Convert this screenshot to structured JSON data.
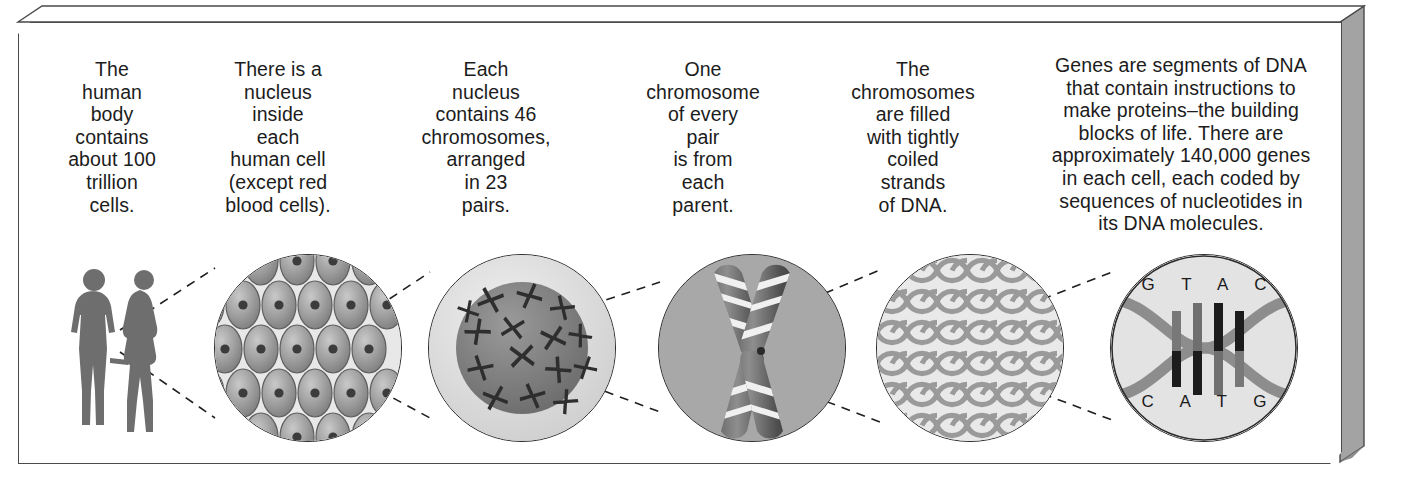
{
  "diagram": {
    "frame": {
      "style": "3d-beveled-slab",
      "border_color": "#4a4a4a",
      "side_color": "#9e9e9e"
    },
    "steps": [
      {
        "id": "body",
        "caption": "The\nhuman\nbody\ncontains\nabout 100\ntrillion\ncells.",
        "illustration": "human-figures-male-female"
      },
      {
        "id": "cells",
        "caption": "There is a\nnucleus\ninside\neach\nhuman cell\n(except red\nblood cells).",
        "illustration": "tissue-of-cells-with-nuclei"
      },
      {
        "id": "nucleus",
        "caption": "Each\nnucleus\ncontains 46\nchromosomes,\narranged\nin 23\npairs.",
        "illustration": "cell-nucleus-with-chromosomes"
      },
      {
        "id": "chromosome",
        "caption": "One\nchromosome\nof every\npair\nis from\neach\nparent.",
        "illustration": "banded-x-chromosome"
      },
      {
        "id": "coils",
        "caption": "The\nchromosomes\nare filled\nwith tightly\ncoiled\nstrands\nof DNA.",
        "illustration": "coiled-dna-strands"
      },
      {
        "id": "dna",
        "caption": "Genes are segments of DNA\nthat contain instructions to\nmake proteins–the building\nblocks of life. There are\napproximately 140,000 genes\nin each cell, each coded by\nsequences of nucleotides in\nits DNA molecules.",
        "illustration": "dna-double-helix",
        "bases_top": "G T A C",
        "bases_bottom": "C A T G"
      }
    ],
    "colors": {
      "text": "#1c1c1c",
      "circle_outline": "#2b2b2b",
      "light_gray": "#e2e2e2",
      "mid_gray": "#a8a8a8",
      "dark_gray": "#6e6e6e",
      "figure_gray": "#707070",
      "connector": "#1f1f1f"
    }
  }
}
